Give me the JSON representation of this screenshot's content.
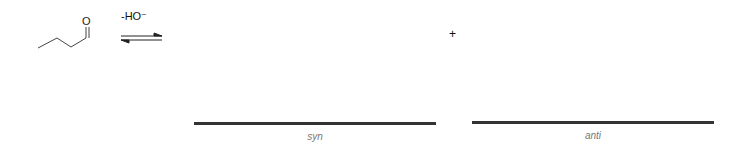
{
  "reaction": {
    "reactant": {
      "name": "butanal",
      "atom_label": "O"
    },
    "reagent": "-HO⁻",
    "arrow": "equilibrium-arrow",
    "plus_sign": "+",
    "products": [
      {
        "blank": true,
        "caption": "syn"
      },
      {
        "blank": true,
        "caption": "anti"
      }
    ]
  },
  "colors": {
    "bond": "#333333",
    "answer_line": "#333333",
    "caption": "#777777"
  }
}
